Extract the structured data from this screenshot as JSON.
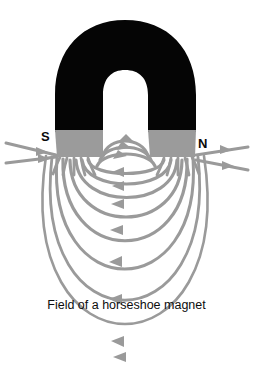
{
  "figure": {
    "title": "Field of a horseshoe magnet",
    "caption": "Field of a horseshoe magnet",
    "type": "physics-diagram",
    "background_color": "#ffffff"
  },
  "magnet": {
    "body_color": "#000000",
    "pole_color": "#9b9b9b",
    "shape": "horseshoe",
    "orientation": "inverted-u",
    "poles": [
      {
        "id": "south",
        "label": "S",
        "side": "left"
      },
      {
        "id": "north",
        "label": "N",
        "side": "right"
      }
    ]
  },
  "field": {
    "line_color": "#9a9a9a",
    "arrow_color": "#9a9a9a",
    "direction": "north-to-south",
    "arc_count": 9,
    "straight_arrow_count": 4
  },
  "labels": {
    "south": "S",
    "north": "N"
  },
  "caption_text": "Field of a horseshoe magnet"
}
